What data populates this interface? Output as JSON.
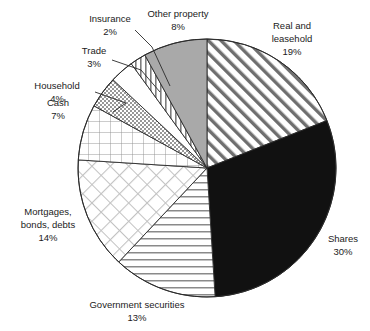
{
  "chart_data": {
    "type": "pie",
    "title": "",
    "subtitle": "",
    "xlabel": "",
    "ylabel": "",
    "legend_position": "none",
    "grid": false,
    "units": "percent",
    "total": 100,
    "start_angle_deg": 0,
    "direction": "clockwise",
    "categories": [
      "Real and leasehold",
      "Shares",
      "Government securities",
      "Mortgages, bonds, debts",
      "Cash",
      "Household",
      "Trade",
      "Insurance",
      "Other property"
    ],
    "values": [
      19,
      30,
      13,
      14,
      7,
      4,
      3,
      2,
      8
    ],
    "slices": [
      {
        "name": "real-and-leasehold",
        "label_lines": [
          "Real and",
          "leasehold",
          "19%"
        ],
        "value": 19,
        "value_text": "19%",
        "fill": "diagonal-stripes-up",
        "fill_color": "#ffffff",
        "stroke_color": "#2b2b2b",
        "leader": false,
        "label_x": 292,
        "label_y": 30
      },
      {
        "name": "shares",
        "label_lines": [
          "Shares",
          "30%"
        ],
        "value": 30,
        "value_text": "30%",
        "fill": "solid-black",
        "fill_color": "#111111",
        "stroke_color": "#2b2b2b",
        "leader": false,
        "label_x": 343,
        "label_y": 240
      },
      {
        "name": "government-securities",
        "label_lines": [
          "Government securities",
          "13%"
        ],
        "value": 13,
        "value_text": "13%",
        "fill": "horizontal-stripes",
        "fill_color": "#ffffff",
        "stroke_color": "#2b2b2b",
        "leader": false,
        "label_x": 113,
        "label_y": 306
      },
      {
        "name": "mortgages-bonds-debts",
        "label_lines": [
          "Mortgages,",
          "bonds, debts",
          "14%"
        ],
        "value": 14,
        "value_text": "14%",
        "fill": "diagonal-crosshatch",
        "fill_color": "#ffffff",
        "stroke_color": "#2b2b2b",
        "leader": false,
        "label_x": 48,
        "label_y": 212
      },
      {
        "name": "cash",
        "label_lines": [
          "Cash",
          "7%"
        ],
        "value": 7,
        "value_text": "7%",
        "fill": "square-grid",
        "fill_color": "#ffffff",
        "stroke_color": "#2b2b2b",
        "leader": false,
        "label_x": 57,
        "label_y": 103
      },
      {
        "name": "household",
        "label_lines": [
          "Household",
          "4%"
        ],
        "value": 4,
        "value_text": "4%",
        "fill": "stipple-gray",
        "fill_color": "#d8d8d8",
        "stroke_color": "#2b2b2b",
        "leader": true,
        "label_x": 55,
        "label_y": 86
      },
      {
        "name": "trade",
        "label_lines": [
          "Trade",
          "3%"
        ],
        "value": 3,
        "value_text": "3%",
        "fill": "blank-white",
        "fill_color": "#ffffff",
        "stroke_color": "#2b2b2b",
        "leader": true,
        "label_x": 93,
        "label_y": 51
      },
      {
        "name": "insurance",
        "label_lines": [
          "Insurance",
          "2%"
        ],
        "value": 2,
        "value_text": "2%",
        "fill": "vertical-stripes",
        "fill_color": "#ffffff",
        "stroke_color": "#2b2b2b",
        "leader": true,
        "label_x": 110,
        "label_y": 18
      },
      {
        "name": "other-property",
        "label_lines": [
          "Other property",
          "8%"
        ],
        "value": 8,
        "value_text": "8%",
        "fill": "solid-gray",
        "fill_color": "#a9a9a9",
        "stroke_color": "#2b2b2b",
        "leader": false,
        "label_x": 175,
        "label_y": 18
      }
    ]
  },
  "labels": {
    "real_and_leasehold_l1": "Real and",
    "real_and_leasehold_l2": "leasehold",
    "real_and_leasehold_pct": "19%",
    "shares_l1": "Shares",
    "shares_pct": "30%",
    "government_securities_l1": "Government securities",
    "government_securities_pct": "13%",
    "mortgages_l1": "Mortgages,",
    "mortgages_l2": "bonds, debts",
    "mortgages_pct": "14%",
    "cash_l1": "Cash",
    "cash_pct": "7%",
    "household_l1": "Household",
    "household_pct": "4%",
    "trade_l1": "Trade",
    "trade_pct": "3%",
    "insurance_l1": "Insurance",
    "insurance_pct": "2%",
    "other_property_l1": "Other property",
    "other_property_pct": "8%"
  },
  "geometry": {
    "center_x": 207,
    "center_y": 168,
    "radius": 129
  },
  "colors": {
    "solid_black": "#111111",
    "solid_gray": "#a9a9a9",
    "stipple_gray": "#d8d8d8",
    "outline": "#2b2b2b",
    "background": "#ffffff",
    "text": "#1b1b1b"
  }
}
